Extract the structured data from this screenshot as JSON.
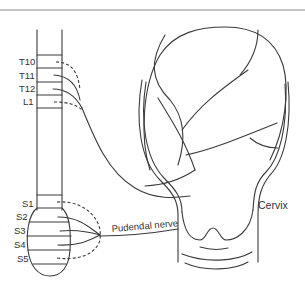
{
  "diagram": {
    "spinal_levels": {
      "thoracolumbar": [
        "T10",
        "T11",
        "T12",
        "L1"
      ],
      "sacral": [
        "S1",
        "S2",
        "S3",
        "S4",
        "S5"
      ]
    },
    "labels": {
      "pudendal_nerve": "Pudendal nerve",
      "cervix": "Cervix"
    },
    "colors": {
      "line": "#3a3a3a",
      "text": "#333333",
      "background": "#ffffff"
    }
  }
}
